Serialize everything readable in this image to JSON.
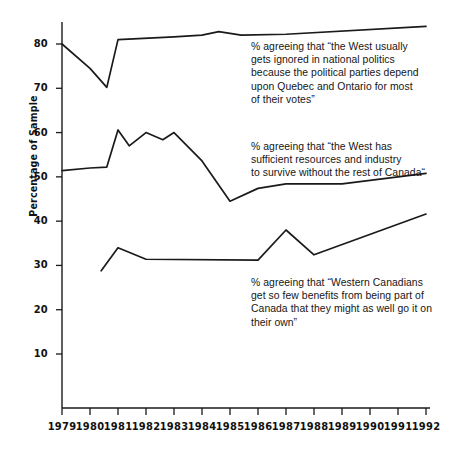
{
  "chart_data": {
    "type": "line",
    "title": "",
    "subtitle": "",
    "xlabel": "",
    "ylabel": "Percentage of Sample",
    "xlim": [
      1979,
      1992
    ],
    "ylim": [
      0,
      88
    ],
    "yticks": [
      10,
      20,
      30,
      40,
      50,
      60,
      70,
      80
    ],
    "xticks": [
      "1979",
      "1980",
      "1981",
      "1982",
      "1983",
      "1984",
      "1985",
      "1986",
      "1987",
      "1988",
      "1989",
      "1990",
      "1991",
      "1992"
    ],
    "grid": false,
    "legend": "none (inline annotations)",
    "line_color": "#1a1a1a",
    "series": [
      {
        "name": "West ignored in national politics",
        "x": [
          1979,
          1980,
          1980.6,
          1981,
          1983,
          1984,
          1984.6,
          1985.4,
          1987,
          1992
        ],
        "values": [
          80.0,
          74.5,
          70.2,
          81.0,
          81.6,
          82.0,
          82.8,
          82.0,
          82.2,
          84.0
        ],
        "annotation": "% agreeing that \"the West usually gets ignored in national politics because the political parties depend upon Quebec and Ontario for most of their votes\""
      },
      {
        "name": "West has sufficient resources and industry",
        "x": [
          1979,
          1980,
          1980.6,
          1981,
          1981.4,
          1982,
          1982.6,
          1983,
          1984,
          1985,
          1986,
          1987,
          1989,
          1992
        ],
        "values": [
          51.4,
          52.0,
          52.2,
          60.6,
          57.0,
          60.0,
          58.4,
          60.0,
          53.6,
          44.5,
          47.4,
          48.4,
          48.4,
          50.8
        ],
        "annotation": "% agreeing that \"the West has sufficient resources and industry to survive without the rest of Canada\""
      },
      {
        "name": "Western Canadians get so few benefits",
        "x": [
          1980.4,
          1981,
          1982,
          1986,
          1987,
          1988,
          1992
        ],
        "values": [
          28.8,
          34.0,
          31.4,
          31.2,
          38.0,
          32.4,
          41.6
        ],
        "annotation": "% agreeing that \"Western Canadians get so few benefits from being part of Canada that they might as well go it on their own\""
      }
    ]
  },
  "annotations": [
    {
      "id": "annotation-west-ignored",
      "lines": [
        "% agreeing that “the West usually",
        "gets ignored in national politics",
        "because the political parties depend",
        "upon Quebec and Ontario for most",
        "of their votes”"
      ]
    },
    {
      "id": "annotation-sufficient-resources",
      "lines": [
        "% agreeing that “the West has",
        "sufficient resources and industry",
        "to survive without the rest of Canada“"
      ]
    },
    {
      "id": "annotation-few-benefits",
      "lines": [
        "% agreeing that “Western Canadians",
        "get so few benefits from being part of",
        "Canada that they might as well go it on",
        "their own”"
      ]
    }
  ]
}
